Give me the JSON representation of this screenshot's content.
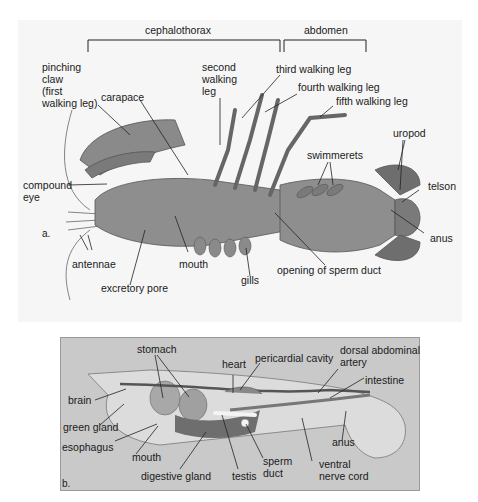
{
  "panel_a": {
    "part_label": "a.",
    "regions": {
      "cephalothorax": "cephalothorax",
      "abdomen": "abdomen"
    },
    "labels": {
      "pinching_claw": "pinching\nclaw\n(first\nwalking leg)",
      "carapace": "carapace",
      "second_walking_leg": "second\nwalking\nleg",
      "third_walking_leg": "third walking leg",
      "fourth_walking_leg": "fourth walking leg",
      "fifth_walking_leg": "fifth walking leg",
      "compound_eye": "compound\neye",
      "swimmerets": "swimmerets",
      "uropod": "uropod",
      "telson": "telson",
      "anus": "anus",
      "antennae": "antennae",
      "mouth": "mouth",
      "gills": "gills",
      "opening_of_sperm_duct": "opening of sperm duct",
      "excretory_pore": "excretory pore"
    }
  },
  "panel_b": {
    "part_label": "b.",
    "labels": {
      "stomach": "stomach",
      "heart": "heart",
      "pericardial_cavity": "pericardial cavity",
      "dorsal_abdominal_artery": "dorsal abdominal\nartery",
      "intestine": "intestine",
      "brain": "brain",
      "green_gland": "green gland",
      "esophagus": "esophagus",
      "mouth": "mouth",
      "digestive_gland": "digestive gland",
      "testis": "testis",
      "sperm_duct": "sperm\nduct",
      "ventral_nerve_cord": "ventral\nnerve cord",
      "anus": "anus"
    }
  },
  "colors": {
    "panel_a_bg": "#f6f6f6",
    "panel_b_bg": "#c9c9c9",
    "body_fill": "#8e8e8e",
    "body_dark": "#5a5a5a",
    "label_text": "#1a1a1a"
  }
}
